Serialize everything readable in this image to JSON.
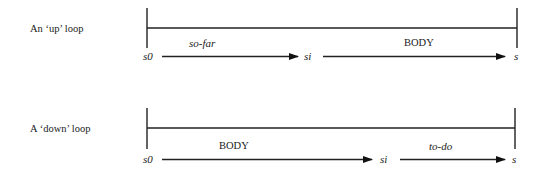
{
  "loops": [
    {
      "label": "An ‘up’ loop",
      "start": "s0",
      "middle": "si",
      "end": "s",
      "segment1": "so-far",
      "segment2": "BODY"
    },
    {
      "label": "A ‘down’ loop",
      "start": "s0",
      "middle": "si",
      "end": "s",
      "segment1": "BODY",
      "segment2": "to-do"
    }
  ]
}
